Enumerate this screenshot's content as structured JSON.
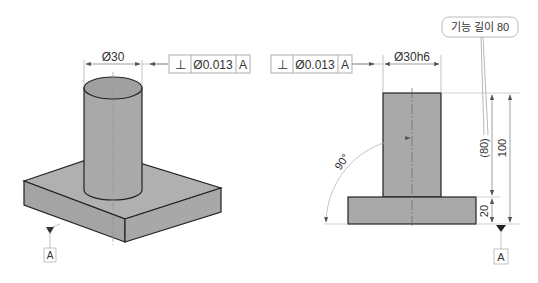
{
  "left_view": {
    "diameter_label": "Ø30",
    "fcf": {
      "symbol": "⊥",
      "tolerance": "Ø0.013",
      "datum": "A"
    },
    "datum_label": "A"
  },
  "right_view": {
    "diameter_label": "Ø30h6",
    "fcf": {
      "symbol": "⊥",
      "tolerance": "Ø0.013",
      "datum": "A"
    },
    "callout": "기능 길이 80",
    "dim_80": "(80)",
    "dim_100": "100",
    "dim_20": "20",
    "angle": "90°",
    "datum_label": "A"
  },
  "colors": {
    "fill": "#a9a9a9",
    "line": "#222222",
    "dim": "#888888"
  }
}
